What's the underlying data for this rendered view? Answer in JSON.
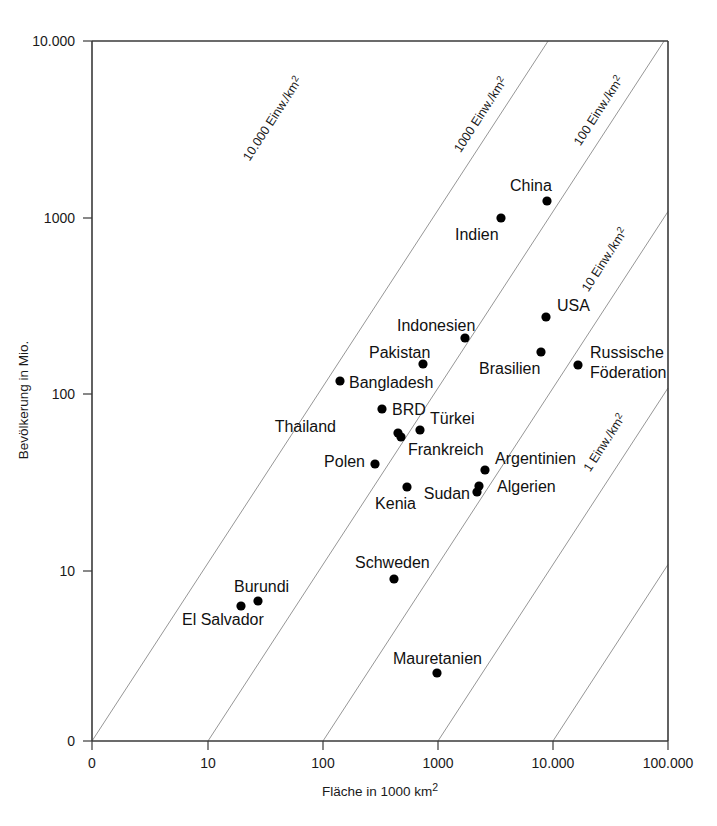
{
  "chart_data": {
    "type": "scatter",
    "title": "",
    "xlabel": "Fläche in 1000 km²",
    "ylabel": "Bevölkerung in Mio.",
    "xscale": "log",
    "yscale": "log",
    "xtick_labels": [
      "0",
      "10",
      "100",
      "1000",
      "10.000",
      "100.000"
    ],
    "ytick_labels": [
      "0",
      "10",
      "100",
      "1000",
      "10.000"
    ],
    "xlim_labels": [
      "0",
      "100.000"
    ],
    "ylim_labels": [
      "0",
      "10.000"
    ],
    "grid": false,
    "legend": "none",
    "annotations": [
      {
        "name": "iso-10000",
        "label": "10.000 Einw./km²",
        "density": 10000
      },
      {
        "name": "iso-1000",
        "label": "1000 Einw./km²",
        "density": 1000
      },
      {
        "name": "iso-100",
        "label": "100 Einw./km²",
        "density": 100
      },
      {
        "name": "iso-10",
        "label": "10 Einw./km²",
        "density": 10
      },
      {
        "name": "iso-1",
        "label": "1 Einw./km²",
        "density": 1
      }
    ],
    "points": [
      {
        "label": "China",
        "x_area_1000km2": 9600,
        "y_pop_mio": 1260,
        "px": 547,
        "py": 201,
        "lx": 510,
        "ly": 191,
        "anchor": "start"
      },
      {
        "label": "Indien",
        "x_area_1000km2": 3290,
        "y_pop_mio": 1000,
        "px": 501,
        "py": 218,
        "lx": 455,
        "ly": 240,
        "anchor": "start"
      },
      {
        "label": "USA",
        "x_area_1000km2": 9370,
        "y_pop_mio": 281,
        "px": 546,
        "py": 317,
        "lx": 557,
        "ly": 311,
        "anchor": "start"
      },
      {
        "label": "Brasilien",
        "x_area_1000km2": 8550,
        "y_pop_mio": 170,
        "px": 541,
        "py": 352,
        "lx": 479,
        "ly": 374,
        "anchor": "start"
      },
      {
        "label": "Russische",
        "x_area_1000km2": 17075,
        "y_pop_mio": 145,
        "px": 578,
        "py": 365,
        "lx": 590,
        "ly": 358,
        "anchor": "start"
      },
      {
        "label": "Föderation",
        "x_area_1000km2": 17075,
        "y_pop_mio": 145,
        "px": -1,
        "py": -1,
        "lx": 590,
        "ly": 378,
        "anchor": "start"
      },
      {
        "label": "Indonesien",
        "x_area_1000km2": 1905,
        "y_pop_mio": 212,
        "px": 465,
        "py": 338,
        "lx": 397,
        "ly": 331,
        "anchor": "start"
      },
      {
        "label": "Pakistan",
        "x_area_1000km2": 796,
        "y_pop_mio": 141,
        "px": 423,
        "py": 364,
        "lx": 369,
        "ly": 358,
        "anchor": "start"
      },
      {
        "label": "Bangladesh",
        "x_area_1000km2": 144,
        "y_pop_mio": 128,
        "px": 340,
        "py": 381,
        "lx": 349,
        "ly": 388,
        "anchor": "start"
      },
      {
        "label": "BRD",
        "x_area_1000km2": 357,
        "y_pop_mio": 82,
        "px": 382,
        "py": 409,
        "lx": 392,
        "ly": 415,
        "anchor": "start"
      },
      {
        "label": "Türkei",
        "x_area_1000km2": 775,
        "y_pop_mio": 66,
        "px": 420,
        "py": 430,
        "lx": 430,
        "ly": 424,
        "anchor": "start"
      },
      {
        "label": "Thailand",
        "x_area_1000km2": 513,
        "y_pop_mio": 61,
        "px": 398,
        "py": 433,
        "lx": 336,
        "ly": 432,
        "anchor": "end"
      },
      {
        "label": "Frankreich",
        "x_area_1000km2": 547,
        "y_pop_mio": 59,
        "px": 401,
        "py": 437,
        "lx": 408,
        "ly": 455,
        "anchor": "start"
      },
      {
        "label": "Polen",
        "x_area_1000km2": 313,
        "y_pop_mio": 39,
        "px": 375,
        "py": 464,
        "lx": 365,
        "ly": 467,
        "anchor": "end"
      },
      {
        "label": "Argentinien",
        "x_area_1000km2": 2780,
        "y_pop_mio": 37,
        "px": 485,
        "py": 470,
        "lx": 495,
        "ly": 464,
        "anchor": "start"
      },
      {
        "label": "Algerien",
        "x_area_1000km2": 2382,
        "y_pop_mio": 31,
        "px": 479,
        "py": 486,
        "lx": 497,
        "ly": 492,
        "anchor": "start"
      },
      {
        "label": "Sudan",
        "x_area_1000km2": 2506,
        "y_pop_mio": 29,
        "px": 477,
        "py": 492,
        "lx": 470,
        "ly": 499,
        "anchor": "end"
      },
      {
        "label": "Kenia",
        "x_area_1000km2": 580,
        "y_pop_mio": 30,
        "px": 407,
        "py": 487,
        "lx": 416,
        "ly": 509,
        "anchor": "end"
      },
      {
        "label": "Schweden",
        "x_area_1000km2": 450,
        "y_pop_mio": 8.9,
        "px": 394,
        "py": 579,
        "lx": 355,
        "ly": 568,
        "anchor": "start"
      },
      {
        "label": "Burundi",
        "x_area_1000km2": 28,
        "y_pop_mio": 6.7,
        "px": 258,
        "py": 601,
        "lx": 234,
        "ly": 592,
        "anchor": "start"
      },
      {
        "label": "El Salvador",
        "x_area_1000km2": 21,
        "y_pop_mio": 6.3,
        "px": 241,
        "py": 606,
        "lx": 182,
        "ly": 625,
        "anchor": "start"
      },
      {
        "label": "Mauretanien",
        "x_area_1000km2": 1031,
        "y_pop_mio": 2.7,
        "px": 437,
        "py": 673,
        "lx": 393,
        "ly": 664,
        "anchor": "start"
      }
    ]
  },
  "axes": {
    "x": {
      "title": "Fläche in 1000 km",
      "title_sup": "2",
      "ticks": [
        {
          "label": "0",
          "px": 92
        },
        {
          "label": "10",
          "px": 208
        },
        {
          "label": "100",
          "px": 323
        },
        {
          "label": "1000",
          "px": 438
        },
        {
          "label": "10.000",
          "px": 553
        },
        {
          "label": "100.000",
          "px": 668
        }
      ]
    },
    "y": {
      "title": "Bevölkerung in Mio.",
      "ticks": [
        {
          "label": "10.000",
          "py": 41
        },
        {
          "label": "1000",
          "py": 218
        },
        {
          "label": "100",
          "py": 394
        },
        {
          "label": "10",
          "py": 571
        },
        {
          "label": "0",
          "py": 741
        }
      ]
    }
  },
  "iso_labels": [
    {
      "text": "10.000 Einw./km",
      "sup": "2",
      "x": 276,
      "y": 121,
      "rotate": -57
    },
    {
      "text": "1000 Einw./km",
      "sup": "2",
      "x": 484,
      "y": 117,
      "rotate": -57
    },
    {
      "text": "100 Einw./km",
      "sup": "2",
      "x": 602,
      "y": 113,
      "rotate": -57
    },
    {
      "text": "10 Einw./km",
      "sup": "2",
      "x": 608,
      "y": 262,
      "rotate": -57
    },
    {
      "text": "1 Einw./km",
      "sup": "2",
      "x": 608,
      "y": 445,
      "rotate": -57
    }
  ],
  "colors": {
    "background": "#ffffff",
    "axis": "#3a3a3a",
    "iso_line": "#8a8a8a",
    "point": "#000000",
    "text": "#111111"
  }
}
